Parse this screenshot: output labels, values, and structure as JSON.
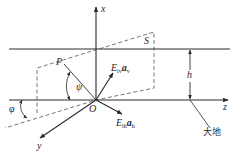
{
  "diagram": {
    "labels": {
      "x_axis": "x",
      "y_axis": "y",
      "z_axis": "z",
      "origin": "O",
      "plane": "S",
      "point": "P",
      "height": "h",
      "psi": "ψ",
      "phi": "φ",
      "ev_E": "E",
      "ev_sub": "iv",
      "ev_a": "a",
      "ev_a_sub": "v",
      "eh_E": "E",
      "eh_sub": "ih",
      "eh_a": "a",
      "eh_a_sub": "h",
      "ground": "大地"
    },
    "colors": {
      "line": "#2a2a2a",
      "dashed": "#555555"
    }
  }
}
